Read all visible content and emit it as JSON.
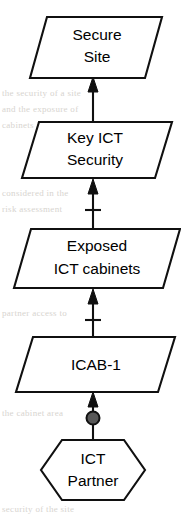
{
  "diagram": {
    "orientation": "bottom-to-top",
    "colors": {
      "stroke": "#101010",
      "node_fill": "#ffffff",
      "dot_fill": "#585858",
      "background": "#ffffff"
    },
    "nodes": [
      {
        "id": "secure-site",
        "shape": "parallelogram",
        "lines": [
          "Secure",
          "Site"
        ],
        "line1": "Secure",
        "line2": "Site"
      },
      {
        "id": "key-ict-security",
        "shape": "parallelogram",
        "lines": [
          "Key ICT",
          "Security"
        ],
        "line1": "Key ICT",
        "line2": "Security"
      },
      {
        "id": "exposed-ict-cabinets",
        "shape": "parallelogram",
        "lines": [
          "Exposed",
          "ICT cabinets"
        ],
        "line1": "Exposed",
        "line2": "ICT cabinets"
      },
      {
        "id": "icab-1",
        "shape": "parallelogram",
        "lines": [
          "ICAB-1"
        ],
        "line1": "ICAB-1",
        "line2": ""
      },
      {
        "id": "ict-partner",
        "shape": "hexagon",
        "lines": [
          "ICT",
          "Partner"
        ],
        "line1": "ICT",
        "line2": "Partner"
      }
    ],
    "connectors": [
      {
        "id": "partner-to-icab1",
        "from": "ict-partner",
        "to": "icab-1",
        "arrow": "up",
        "marker": "filled-circle",
        "tick": false
      },
      {
        "id": "icab1-to-exposed",
        "from": "icab-1",
        "to": "exposed-ict-cabinets",
        "arrow": "up",
        "marker": "none",
        "tick": true
      },
      {
        "id": "exposed-to-key-security",
        "from": "exposed-ict-cabinets",
        "to": "key-ict-security",
        "arrow": "up",
        "marker": "none",
        "tick": true
      },
      {
        "id": "key-security-to-secure-site",
        "from": "key-ict-security",
        "to": "secure-site",
        "arrow": "up",
        "marker": "none",
        "tick": false
      }
    ]
  }
}
